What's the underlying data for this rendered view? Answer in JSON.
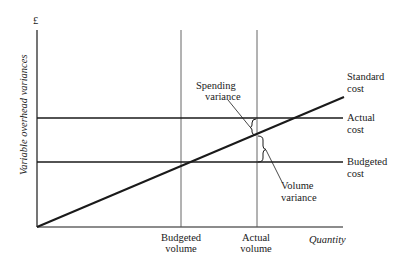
{
  "diagram": {
    "type": "cost-volume variance diagram",
    "y_axis": {
      "unit_symbol": "£",
      "label": "Variable overhead variances"
    },
    "x_axis": {
      "label": "Quantity",
      "ticks": [
        {
          "line1": "Budgeted",
          "line2": "volume"
        },
        {
          "line1": "Actual",
          "line2": "volume"
        }
      ]
    },
    "lines": [
      {
        "line1": "Standard",
        "line2": "cost",
        "kind": "sloped"
      },
      {
        "line1": "Actual",
        "line2": "cost",
        "kind": "horizontal"
      },
      {
        "line1": "Budgeted",
        "line2": "cost",
        "kind": "horizontal"
      }
    ],
    "annotations": [
      {
        "line1": "Spending",
        "line2": "variance"
      },
      {
        "line1": "Volume",
        "line2": "variance"
      }
    ],
    "colors": {
      "line": "#1a1a1a",
      "thin_line": "#555555",
      "background": "#ffffff"
    }
  }
}
